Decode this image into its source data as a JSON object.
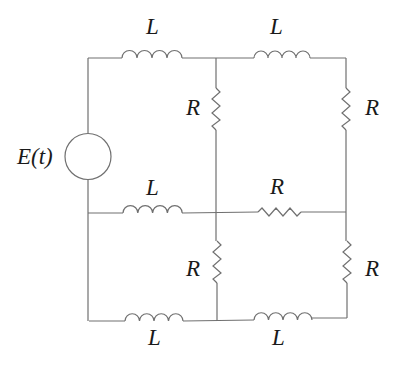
{
  "diagram": {
    "type": "circuit",
    "source": {
      "label": "E(t)",
      "kind": "ac-voltage-source"
    },
    "components": [
      {
        "id": "L1",
        "kind": "inductor",
        "label": "L",
        "position": "top-left branch"
      },
      {
        "id": "L2",
        "kind": "inductor",
        "label": "L",
        "position": "top-right branch"
      },
      {
        "id": "R1",
        "kind": "resistor",
        "label": "R",
        "position": "upper-middle vertical"
      },
      {
        "id": "R2",
        "kind": "resistor",
        "label": "R",
        "position": "upper-right vertical"
      },
      {
        "id": "L3",
        "kind": "inductor",
        "label": "L",
        "position": "middle-left branch"
      },
      {
        "id": "R3",
        "kind": "resistor",
        "label": "R",
        "position": "middle-right branch"
      },
      {
        "id": "R4",
        "kind": "resistor",
        "label": "R",
        "position": "lower-middle vertical"
      },
      {
        "id": "R5",
        "kind": "resistor",
        "label": "R",
        "position": "lower-right vertical"
      },
      {
        "id": "L4",
        "kind": "inductor",
        "label": "L",
        "position": "bottom-left branch"
      },
      {
        "id": "L5",
        "kind": "inductor",
        "label": "L",
        "position": "bottom-right branch"
      }
    ],
    "colors": {
      "wire": "#707070",
      "text": "#1a1a1a",
      "background": "#ffffff"
    }
  }
}
